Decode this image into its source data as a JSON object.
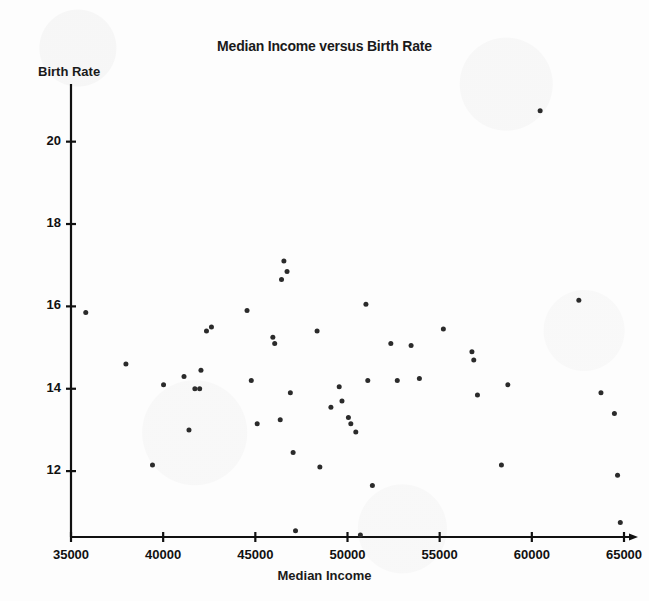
{
  "chart_data": {
    "type": "scatter",
    "title": "Median Income versus Birth Rate",
    "xlabel": "Median Income",
    "ylabel": "Birth Rate",
    "xlim": [
      35000,
      65000
    ],
    "ylim": [
      10.4,
      21.4
    ],
    "xticks": [
      35000,
      40000,
      45000,
      50000,
      55000,
      60000,
      65000
    ],
    "xtick_labels": [
      "35000",
      "40000",
      "45000",
      "50000",
      "55000",
      "60000",
      "65000"
    ],
    "yticks": [
      12,
      14,
      16,
      18,
      20
    ],
    "ytick_labels": [
      "12",
      "14",
      "16",
      "18",
      "20"
    ],
    "grid": false,
    "legend": null,
    "marker_color": "#2b2b2b",
    "axis_color": "#111111",
    "marker_size": 5,
    "series": [
      {
        "name": "States",
        "points": [
          [
            35800,
            15.85
          ],
          [
            37980,
            14.6
          ],
          [
            39420,
            12.15
          ],
          [
            40020,
            14.1
          ],
          [
            41130,
            14.3
          ],
          [
            41400,
            13.0
          ],
          [
            41720,
            14.0
          ],
          [
            41980,
            14.0
          ],
          [
            42050,
            14.45
          ],
          [
            42350,
            15.4
          ],
          [
            42620,
            15.5
          ],
          [
            44550,
            15.9
          ],
          [
            44780,
            14.2
          ],
          [
            45100,
            13.15
          ],
          [
            45950,
            15.25
          ],
          [
            46050,
            15.1
          ],
          [
            46350,
            13.25
          ],
          [
            46420,
            16.65
          ],
          [
            46550,
            17.1
          ],
          [
            46720,
            16.85
          ],
          [
            46900,
            13.9
          ],
          [
            47050,
            12.45
          ],
          [
            47180,
            10.55
          ],
          [
            48350,
            15.4
          ],
          [
            48500,
            12.1
          ],
          [
            49100,
            13.55
          ],
          [
            49550,
            14.05
          ],
          [
            49700,
            13.7
          ],
          [
            50050,
            13.3
          ],
          [
            50180,
            13.15
          ],
          [
            50450,
            12.95
          ],
          [
            50700,
            10.45
          ],
          [
            51000,
            16.05
          ],
          [
            51100,
            14.2
          ],
          [
            51350,
            11.65
          ],
          [
            52350,
            15.1
          ],
          [
            52700,
            14.2
          ],
          [
            53450,
            15.05
          ],
          [
            53900,
            14.25
          ],
          [
            55200,
            15.45
          ],
          [
            56750,
            14.9
          ],
          [
            56850,
            14.7
          ],
          [
            57050,
            13.85
          ],
          [
            58350,
            12.15
          ],
          [
            58700,
            14.1
          ],
          [
            60450,
            20.75
          ],
          [
            62550,
            16.15
          ],
          [
            63750,
            13.9
          ],
          [
            64480,
            13.4
          ],
          [
            64650,
            11.9
          ],
          [
            64800,
            10.75
          ]
        ]
      }
    ]
  }
}
